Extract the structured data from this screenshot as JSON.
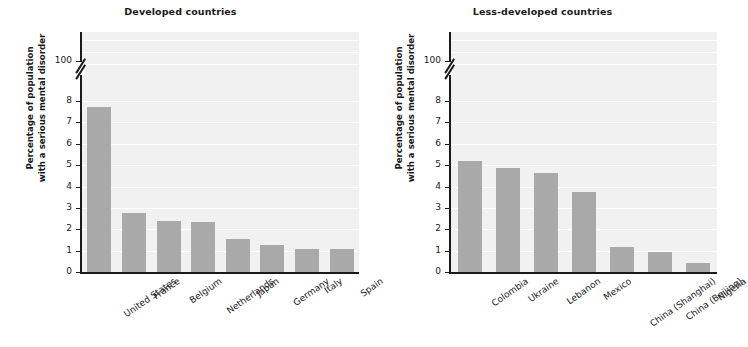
{
  "figure": {
    "axis_title": {
      "line1": "Percentage of population",
      "line2": "with a serious mental disorder"
    },
    "bar_color": "#a9a9a9",
    "plot_background": "#f1f1f1",
    "gridline_color": "#ffffff",
    "axis_color": "#1a1a1a"
  },
  "chart_data": [
    {
      "type": "bar",
      "title": "Developed countries",
      "xlabel": "",
      "ylabel": "Percentage of population with a serious mental disorder",
      "ylim": [
        0,
        8
      ],
      "axis_break": true,
      "axis_break_top_label": "100",
      "grid": true,
      "tick_labels": [
        "0",
        "1",
        "2",
        "3",
        "4",
        "5",
        "6",
        "7",
        "8",
        "100"
      ],
      "categories": [
        "United States",
        "France",
        "Belgium",
        "Netherlands",
        "Japan",
        "Germany",
        "Italy",
        "Spain"
      ],
      "values": [
        7.7,
        2.75,
        2.4,
        2.35,
        1.55,
        1.25,
        1.1,
        1.1
      ]
    },
    {
      "type": "bar",
      "title": "Less-developed countries",
      "xlabel": "",
      "ylabel": "Percentage of population with a serious mental disorder",
      "ylim": [
        0,
        8
      ],
      "axis_break": true,
      "axis_break_top_label": "100",
      "grid": true,
      "tick_labels": [
        "0",
        "1",
        "2",
        "3",
        "4",
        "5",
        "6",
        "7",
        "8",
        "100"
      ],
      "categories": [
        "Colombia",
        "Ukraine",
        "Lebanon",
        "Mexico",
        "China (Shanghai)",
        "China (Beijing)",
        "Nigeria"
      ],
      "values": [
        5.2,
        4.85,
        4.65,
        3.75,
        1.15,
        0.95,
        0.4
      ]
    }
  ]
}
